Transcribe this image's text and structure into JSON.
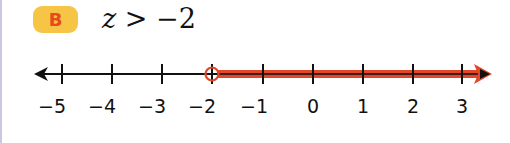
{
  "problem": {
    "label": "B",
    "variable": "z",
    "operator": ">",
    "value": "−2"
  },
  "number_line": {
    "min": -5,
    "max": 3,
    "ticks": [
      "−5",
      "−4",
      "−3",
      "−2",
      "−1",
      "0",
      "1",
      "2",
      "3"
    ],
    "boundary": -2,
    "boundary_type": "open-circle",
    "shaded_direction": "right",
    "colors": {
      "line": "#111111",
      "shading": "#e2472a",
      "badge_bg": "#f7c546",
      "badge_text": "#e8491d"
    }
  }
}
